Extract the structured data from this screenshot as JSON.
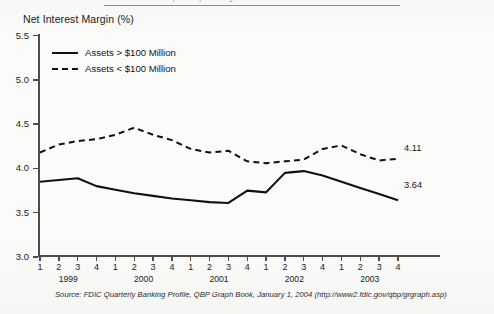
{
  "page": {
    "top_cut_text": "FDIC Quarterly Banking Profile"
  },
  "chart_title": "Net Interest Margin (%)",
  "legend": {
    "items": [
      {
        "label": "Assets > $100 Million",
        "style": "solid"
      },
      {
        "label": "Assets < $100 Million",
        "style": "dashed"
      }
    ]
  },
  "axis": {
    "y_labels": [
      "5.5",
      "5.0",
      "4.5",
      "4.0",
      "3.5",
      "3.0"
    ],
    "quarter_labels": [
      "1",
      "2",
      "3",
      "4",
      "1",
      "2",
      "3",
      "4",
      "1",
      "2",
      "3",
      "4",
      "1",
      "2",
      "3",
      "4",
      "1",
      "2",
      "3",
      "4"
    ],
    "year_labels": [
      "1999",
      "2000",
      "2001",
      "2002",
      "2003"
    ]
  },
  "end_labels": {
    "large_banks": "3.64",
    "small_banks": "4.11"
  },
  "source": "Source: FDIC Quarterly Banking Profile, QBP Graph Book, January 1, 2004 (http://www2.fdic.gov/qbp/grgraph.asp)",
  "colors": {
    "line": "#111111",
    "axis": "#4d4d4d",
    "text": "#141414",
    "background": "#fbfbfa"
  },
  "chart_data": {
    "type": "line",
    "title": "Net Interest Margin (%)",
    "xlabel": "",
    "ylabel": "Net Interest Margin (%)",
    "ylim": [
      3.0,
      5.5
    ],
    "ytick_values": [
      3.0,
      3.5,
      4.0,
      4.5,
      5.0,
      5.5
    ],
    "grid": false,
    "legend_position": "upper-left",
    "x": [
      "1999 Q1",
      "1999 Q2",
      "1999 Q3",
      "1999 Q4",
      "2000 Q1",
      "2000 Q2",
      "2000 Q3",
      "2000 Q4",
      "2001 Q1",
      "2001 Q2",
      "2001 Q3",
      "2001 Q4",
      "2002 Q1",
      "2002 Q2",
      "2002 Q3",
      "2002 Q4",
      "2003 Q1",
      "2003 Q2",
      "2003 Q3",
      "2003 Q4"
    ],
    "series": [
      {
        "name": "Assets > $100 Million",
        "style": "solid",
        "end_value_label": "3.64",
        "values": [
          3.85,
          3.87,
          3.89,
          3.8,
          3.76,
          3.72,
          3.69,
          3.66,
          3.64,
          3.62,
          3.61,
          3.75,
          3.73,
          3.95,
          3.97,
          3.92,
          3.85,
          3.78,
          3.71,
          3.64
        ]
      },
      {
        "name": "Assets < $100 Million",
        "style": "dashed",
        "end_value_label": "4.11",
        "values": [
          4.18,
          4.27,
          4.31,
          4.33,
          4.38,
          4.46,
          4.38,
          4.32,
          4.22,
          4.18,
          4.2,
          4.08,
          4.06,
          4.08,
          4.1,
          4.22,
          4.26,
          4.16,
          4.09,
          4.11
        ]
      }
    ]
  }
}
